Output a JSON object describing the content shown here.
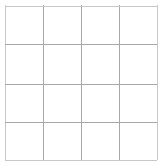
{
  "canvas": {
    "width": 161,
    "height": 165,
    "background_color": "#ffffff"
  },
  "grid": {
    "label": "4 by 4 empty grid",
    "columns": 4,
    "rows": 4,
    "origin_x": 5,
    "origin_y": 5,
    "width": 152,
    "height": 155,
    "line_color": "#b4b4b4",
    "edge_line_color": "#c8c8c8",
    "inner_line_color": "#a8a8a8",
    "line_width": 1,
    "vertical_line_x": [
      0,
      37.5,
      75.5,
      113.5,
      151.5
    ],
    "horizontal_line_y": [
      0.5,
      39,
      78.5,
      116.5,
      154.5
    ],
    "cells": [
      {
        "row": 0,
        "col": 0,
        "text": ""
      },
      {
        "row": 0,
        "col": 1,
        "text": ""
      },
      {
        "row": 0,
        "col": 2,
        "text": ""
      },
      {
        "row": 0,
        "col": 3,
        "text": ""
      },
      {
        "row": 1,
        "col": 0,
        "text": ""
      },
      {
        "row": 1,
        "col": 1,
        "text": ""
      },
      {
        "row": 1,
        "col": 2,
        "text": ""
      },
      {
        "row": 1,
        "col": 3,
        "text": ""
      },
      {
        "row": 2,
        "col": 0,
        "text": ""
      },
      {
        "row": 2,
        "col": 1,
        "text": ""
      },
      {
        "row": 2,
        "col": 2,
        "text": ""
      },
      {
        "row": 2,
        "col": 3,
        "text": ""
      },
      {
        "row": 3,
        "col": 0,
        "text": ""
      },
      {
        "row": 3,
        "col": 1,
        "text": ""
      },
      {
        "row": 3,
        "col": 2,
        "text": ""
      },
      {
        "row": 3,
        "col": 3,
        "text": ""
      }
    ]
  }
}
